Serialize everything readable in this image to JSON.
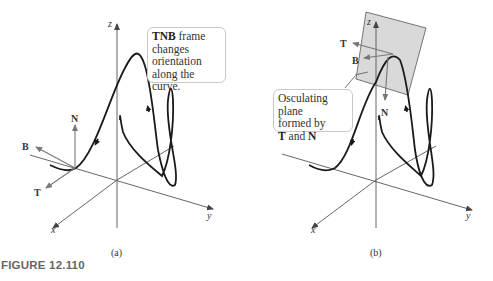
{
  "figure": {
    "caption": "FIGURE 12.110",
    "panels": [
      {
        "id": "a",
        "sublabel": "(a)",
        "axes": {
          "x": "x",
          "y": "y",
          "z": "z"
        },
        "vectors": {
          "T": "T",
          "N": "N",
          "B": "B"
        },
        "callout": {
          "bold": "TNB",
          "line1_rest": " frame",
          "line2": "changes",
          "line3": "orientation",
          "line4": "along the curve."
        }
      },
      {
        "id": "b",
        "sublabel": "(b)",
        "axes": {
          "x": "x",
          "y": "y",
          "z": "z"
        },
        "vectors": {
          "T": "T",
          "N": "N",
          "B": "B"
        },
        "callout": {
          "line1": "Osculating plane",
          "line2": "formed by",
          "bold1": "T",
          "mid": " and ",
          "bold2": "N"
        }
      }
    ]
  },
  "colors": {
    "curve": "#1a1a1a",
    "axis": "#555555",
    "vector": "#666666",
    "plane": "#d9d9d9",
    "plane_border": "#555555",
    "callout_border": "#c8c8c8",
    "caption": "#666666"
  }
}
